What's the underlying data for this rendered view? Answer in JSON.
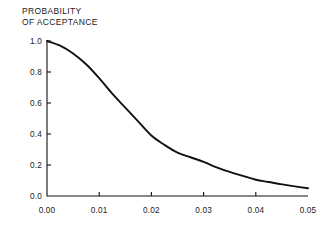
{
  "chart_data": {
    "type": "line",
    "title": "PROBABILITY\nOF ACCEPTANCE",
    "title_line1": "PROBABILITY",
    "title_line2": "OF ACCEPTANCE",
    "xlabel": "",
    "ylabel": "",
    "xlim": [
      0.0,
      0.05
    ],
    "ylim": [
      0.0,
      1.0
    ],
    "grid": false,
    "legend": false,
    "legend_position": "none",
    "axis_style": "left-and-bottom-spines",
    "tick_direction": "in",
    "line_color": "#111111",
    "background_color": "#ffffff",
    "xticks": [
      0.0,
      0.01,
      0.02,
      0.03,
      0.04,
      0.05
    ],
    "xticklabels": [
      "0.00",
      "0.01",
      "0.02",
      "0.03",
      "0.04",
      "0.05"
    ],
    "yticks": [
      0.0,
      0.2,
      0.4,
      0.6,
      0.8,
      1.0
    ],
    "yticklabels": [
      "0.0",
      "0.2",
      "0.4",
      "0.6",
      "0.8",
      "1.0"
    ],
    "series": [
      {
        "name": "Probability of acceptance",
        "x": [
          0.0,
          0.0025,
          0.005,
          0.0075,
          0.01,
          0.0125,
          0.015,
          0.0175,
          0.02,
          0.0225,
          0.025,
          0.0275,
          0.03,
          0.0325,
          0.035,
          0.0375,
          0.04,
          0.0425,
          0.045,
          0.0475,
          0.05
        ],
        "values": [
          1.0,
          0.97,
          0.92,
          0.85,
          0.76,
          0.66,
          0.57,
          0.48,
          0.39,
          0.33,
          0.28,
          0.25,
          0.22,
          0.185,
          0.155,
          0.13,
          0.105,
          0.09,
          0.075,
          0.062,
          0.05
        ]
      }
    ]
  }
}
